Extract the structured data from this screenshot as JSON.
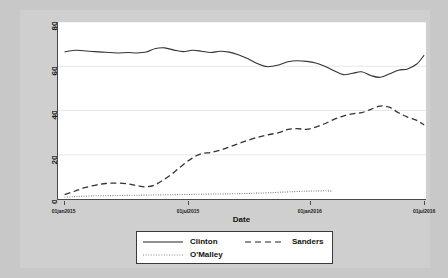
{
  "chart_data": {
    "type": "line",
    "title": "",
    "xlabel": "Date",
    "ylabel": "",
    "ylim": [
      0,
      80
    ],
    "yticks": [
      0,
      20,
      40,
      60,
      80
    ],
    "xticks": [
      "01jan2015",
      "01jul2015",
      "01jan2016",
      "01jul2016"
    ],
    "xlim": [
      "01jan2015",
      "01jul2016"
    ],
    "grid": true,
    "legend_position": "bottom",
    "series": [
      {
        "name": "Clinton",
        "style": "solid",
        "color": "#333333",
        "x": [
          0.018,
          0.045,
          0.07,
          0.1,
          0.13,
          0.16,
          0.19,
          0.215,
          0.24,
          0.265,
          0.29,
          0.315,
          0.34,
          0.365,
          0.39,
          0.415,
          0.44,
          0.465,
          0.49,
          0.515,
          0.545,
          0.57,
          0.6,
          0.625,
          0.65,
          0.675,
          0.7,
          0.725,
          0.75,
          0.775,
          0.8,
          0.825,
          0.85,
          0.875,
          0.9,
          0.925,
          0.95,
          0.975,
          0.995
        ],
        "y": [
          66.5,
          67.2,
          67.0,
          66.6,
          66.3,
          66.0,
          66.2,
          66.0,
          66.4,
          68.0,
          68.3,
          67.3,
          66.6,
          67.2,
          66.8,
          66.2,
          66.8,
          66.4,
          65.2,
          63.5,
          61.0,
          59.8,
          60.6,
          62.0,
          62.5,
          62.2,
          61.5,
          60.0,
          58.0,
          56.2,
          56.8,
          57.5,
          55.8,
          55.0,
          56.5,
          58.2,
          58.8,
          61.0,
          65.0
        ]
      },
      {
        "name": "Sanders",
        "style": "dashed",
        "color": "#333333",
        "x": [
          0.018,
          0.045,
          0.07,
          0.1,
          0.13,
          0.16,
          0.19,
          0.215,
          0.24,
          0.265,
          0.29,
          0.315,
          0.34,
          0.365,
          0.39,
          0.415,
          0.44,
          0.465,
          0.49,
          0.515,
          0.545,
          0.57,
          0.6,
          0.625,
          0.65,
          0.675,
          0.7,
          0.725,
          0.75,
          0.775,
          0.8,
          0.825,
          0.85,
          0.875,
          0.9,
          0.925,
          0.95,
          0.975,
          0.995
        ],
        "y": [
          2.0,
          3.5,
          5.0,
          6.2,
          7.0,
          7.2,
          6.8,
          6.0,
          5.5,
          6.5,
          9.0,
          12.0,
          15.5,
          18.5,
          20.5,
          21.0,
          22.0,
          23.5,
          25.0,
          26.5,
          28.0,
          29.0,
          30.0,
          31.5,
          31.8,
          31.5,
          32.5,
          34.0,
          36.0,
          37.5,
          38.5,
          39.0,
          40.5,
          42.0,
          41.5,
          39.0,
          37.0,
          35.5,
          33.5
        ]
      },
      {
        "name": "O'Malley",
        "style": "dotted",
        "color": "#6f6f6f",
        "x": [
          0.018,
          0.05,
          0.09,
          0.13,
          0.17,
          0.21,
          0.25,
          0.29,
          0.33,
          0.37,
          0.41,
          0.45,
          0.49,
          0.53,
          0.57,
          0.61,
          0.65,
          0.69,
          0.73,
          0.745
        ],
        "y": [
          0.8,
          1.1,
          1.4,
          1.5,
          1.6,
          1.7,
          1.8,
          1.9,
          2.0,
          2.1,
          2.2,
          2.3,
          2.4,
          2.6,
          2.8,
          3.1,
          3.4,
          3.6,
          3.7,
          3.5
        ]
      }
    ]
  },
  "axis": {
    "x_title": "Date",
    "y_ticks": [
      "0",
      "20",
      "40",
      "60",
      "80"
    ],
    "x_ticks": [
      "01jan2015",
      "01jul2015",
      "01jan2016",
      "01jul2016"
    ]
  },
  "legend": {
    "clinton_label": "Clinton",
    "sanders_label": "Sanders",
    "omalley_label": "O'Malley"
  },
  "colors": {
    "background": "#cfcfcf",
    "plot_background": "#ffffff",
    "line": "#333333",
    "grid": "#e8e8e8",
    "axis": "#4a4a4a"
  }
}
